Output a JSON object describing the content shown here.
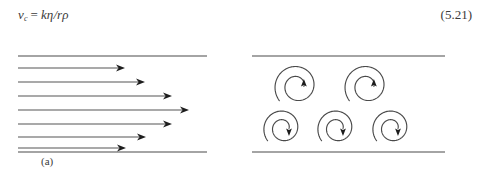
{
  "equation": {
    "variable": "v",
    "subscript": "c",
    "equals": "=",
    "right_hand_side": "kη/rρ",
    "plain_text": "v_c = kη/rρ",
    "number": "(5.21)"
  },
  "figure": {
    "panels": [
      {
        "id": "a",
        "caption": "(a)",
        "flow_type": "laminar",
        "description": "parallel streamlines with arrowheads forming a parabolic velocity profile between two channel walls",
        "walls": [
          {
            "name": "top-wall",
            "x1": 18,
            "y1": 20,
            "x2": 207,
            "y2": 20
          },
          {
            "name": "bottom-wall",
            "x1": 18,
            "y1": 116,
            "x2": 207,
            "y2": 116
          }
        ],
        "streamlines": [
          {
            "index": 1,
            "y": 32,
            "x_start": 18,
            "x_tip": 125
          },
          {
            "index": 2,
            "y": 46,
            "x_start": 18,
            "x_tip": 145
          },
          {
            "index": 3,
            "y": 60,
            "x_start": 18,
            "x_tip": 172
          },
          {
            "index": 4,
            "y": 74,
            "x_start": 18,
            "x_tip": 189
          },
          {
            "index": 5,
            "y": 88,
            "x_start": 18,
            "x_tip": 172
          },
          {
            "index": 6,
            "y": 101,
            "x_start": 18,
            "x_tip": 146
          },
          {
            "index": 7,
            "y": 112,
            "x_start": 18,
            "x_tip": 126
          }
        ]
      },
      {
        "id": "b",
        "caption": "(b)",
        "flow_type": "turbulent",
        "description": "five spiral eddies between two channel walls; upper row arrows point up, lower row arrows point down",
        "walls": [
          {
            "name": "top-wall",
            "x1": 7,
            "y1": 20,
            "x2": 200,
            "y2": 20
          },
          {
            "name": "bottom-wall",
            "x1": 7,
            "y1": 116,
            "x2": 200,
            "y2": 116
          }
        ],
        "eddies": [
          {
            "index": 1,
            "row": "top",
            "cx": 52,
            "cy": 50,
            "r": 23,
            "arrow_direction": "up"
          },
          {
            "index": 2,
            "row": "top",
            "cx": 122,
            "cy": 50,
            "r": 23,
            "arrow_direction": "up"
          },
          {
            "index": 3,
            "row": "bottom",
            "cx": 38,
            "cy": 92,
            "r": 20,
            "arrow_direction": "down"
          },
          {
            "index": 4,
            "row": "bottom",
            "cx": 92,
            "cy": 92,
            "r": 20,
            "arrow_direction": "down"
          },
          {
            "index": 5,
            "row": "bottom",
            "cx": 147,
            "cy": 92,
            "r": 20,
            "arrow_direction": "down"
          }
        ]
      }
    ]
  },
  "colors": {
    "ink": "#3b3b3b",
    "line": "#4a4a4a",
    "arrow": "#1d1d1d",
    "background": "#ffffff"
  }
}
